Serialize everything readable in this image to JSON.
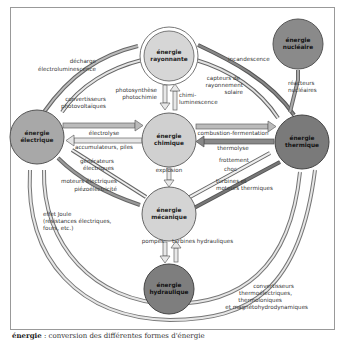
{
  "diagram": {
    "nodes": {
      "rayonnante": {
        "line1": "énergie",
        "line2": "rayonnante",
        "color": "#d6d6d6"
      },
      "nucleaire": {
        "line1": "énergie",
        "line2": "nucléaire",
        "color": "#8a8a8a"
      },
      "electrique": {
        "line1": "énergie",
        "line2": "électrique",
        "color": "#a8a8a8"
      },
      "chimique": {
        "line1": "énergie",
        "line2": "chimique",
        "color": "#d0d0d0"
      },
      "thermique": {
        "line1": "énergie",
        "line2": "thermique",
        "color": "#7a7a7a"
      },
      "mecanique": {
        "line1": "énergie",
        "line2": "mécanique",
        "color": "#d4d4d4"
      },
      "hydraulique": {
        "line1": "énergie",
        "line2": "hydraulique",
        "color": "#7e7e7e"
      }
    },
    "labels": {
      "decharge": "décharge",
      "electroluminescence": "électroluminescence",
      "convertisseurs": "convertisseurs",
      "photovoltaiques": "photovoltaïques",
      "photosynthese": "photosynthèse",
      "photochimie": "photochimie",
      "chimi": "chimi-",
      "luminescence": "luminescence",
      "incandescence": "incandescence",
      "capteurs1": "capteurs de",
      "capteurs2": "rayonnement",
      "capteurs3": "solaire",
      "reacteurs1": "réacteurs",
      "reacteurs2": "nucléaires",
      "electrolyse": "électrolyse",
      "accumulateurs": "accumulateurs, piles",
      "combustion": "combustion-fermentation",
      "thermolyse": "thermolyse",
      "generateurs1": "générateurs",
      "generateurs2": "électriques",
      "frottement": "frottement",
      "choc": "choc",
      "explosion": "explosion",
      "moteurs1": "moteurs électriques",
      "moteurs2": "piézoélectricité",
      "turbines_th1": "turbines et",
      "turbines_th2": "moteurs thermiques",
      "joule1": "effet Joule",
      "joule2": "(résistances électriques,",
      "joule3": "fours, etc.)",
      "pompes": "pompes",
      "turbines_hyd": "turbines hydrauliques",
      "conv_th1": "convertisseurs",
      "conv_th2": "thermoélectriques,",
      "conv_th3": "thermoioniques",
      "conv_th4": "et magnétohydrodynamiques"
    }
  },
  "caption": {
    "term": "énergie",
    "text": " : conversion des différentes formes d'énergie"
  }
}
